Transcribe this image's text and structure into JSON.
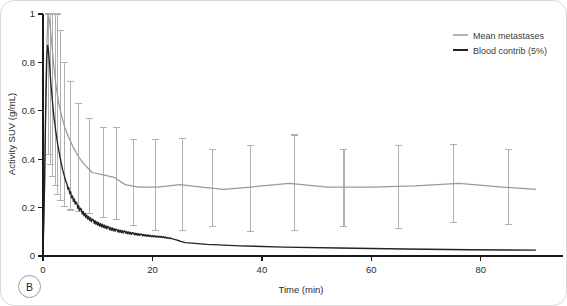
{
  "panel": {
    "letter": "B"
  },
  "legend": {
    "position": "top-right",
    "entries": [
      {
        "label": "Mean metastases",
        "color": "#9a9a9a",
        "style": "thin-line"
      },
      {
        "label": "Blood contrib (5%)",
        "color": "#242424",
        "style": "thick-line"
      }
    ]
  },
  "chart_data": {
    "type": "line",
    "title": "",
    "subtitle": "",
    "xlabel": "Time (min)",
    "ylabel": "Activity SUV (g/mL)",
    "xlim": [
      0,
      91
    ],
    "ylim": [
      0,
      1
    ],
    "xticks": [
      0,
      20,
      40,
      60,
      80
    ],
    "yticks": [
      0,
      0.2,
      0.4,
      0.6,
      0.8,
      1
    ],
    "xtick_labels": [
      "0",
      "20",
      "40",
      "60",
      "80"
    ],
    "ytick_labels": [
      "0",
      "0.2",
      "0.4",
      "0.6",
      "0.8",
      "1"
    ],
    "grid": false,
    "legend_position": "upper right",
    "annotations": [
      "B"
    ],
    "series": [
      {
        "name": "Mean metastases",
        "color": "#9a9a9a",
        "has_errorbars": true,
        "x": [
          0.0,
          0.3,
          0.6,
          0.9,
          1.2,
          1.6,
          2.0,
          2.4,
          2.9,
          3.4,
          4.0,
          4.7,
          5.5,
          6.5,
          7.5,
          9.0,
          11.0,
          13.0,
          15.0,
          17.5,
          21.0,
          25.0,
          29.0,
          33.0,
          38.0,
          45.0,
          52.0,
          60.0,
          68.0,
          76.0,
          84.0,
          90.0
        ],
        "values": [
          0.02,
          0.3,
          0.8,
          1.0,
          0.97,
          0.88,
          0.78,
          0.7,
          0.63,
          0.58,
          0.53,
          0.49,
          0.45,
          0.41,
          0.38,
          0.345,
          0.335,
          0.325,
          0.295,
          0.285,
          0.285,
          0.295,
          0.285,
          0.275,
          0.285,
          0.3,
          0.285,
          0.285,
          0.29,
          0.3,
          0.285,
          0.275
        ],
        "errorbars": {
          "x": [
            1.0,
            1.4,
            1.8,
            2.2,
            2.7,
            3.2,
            4.0,
            5.0,
            6.5,
            8.5,
            11.0,
            13.5,
            16.5,
            20.5,
            25.5,
            31.0,
            38.0,
            46.0,
            55.0,
            65.0,
            75.0,
            85.0
          ],
          "center": [
            1.0,
            0.93,
            0.82,
            0.74,
            0.66,
            0.6,
            0.53,
            0.46,
            0.405,
            0.355,
            0.335,
            0.325,
            0.295,
            0.285,
            0.295,
            0.285,
            0.275,
            0.3,
            0.285,
            0.285,
            0.3,
            0.285
          ],
          "upper": [
            1.0,
            1.0,
            1.0,
            1.0,
            1.0,
            0.93,
            0.8,
            0.72,
            0.63,
            0.57,
            0.53,
            0.53,
            0.48,
            0.48,
            0.485,
            0.44,
            0.455,
            0.5,
            0.44,
            0.455,
            0.46,
            0.44
          ],
          "lower": [
            0.42,
            0.38,
            0.33,
            0.29,
            0.255,
            0.23,
            0.205,
            0.19,
            0.185,
            0.175,
            0.16,
            0.15,
            0.125,
            0.105,
            0.105,
            0.12,
            0.1,
            0.105,
            0.12,
            0.115,
            0.14,
            0.13
          ]
        }
      },
      {
        "name": "Blood contrib (5%)",
        "color": "#242424",
        "has_errorbars": false,
        "x": [
          0.0,
          0.25,
          0.5,
          0.7,
          0.85,
          1.0,
          1.2,
          1.45,
          1.7,
          2.0,
          2.3,
          2.7,
          3.1,
          3.6,
          4.1,
          4.7,
          5.4,
          6.2,
          7.0,
          8.0,
          9.2,
          10.5,
          12.0,
          13.5,
          15.0,
          16.5,
          18.0,
          20.0,
          22.0,
          23.5,
          26.0,
          30.0,
          36.0,
          44.0,
          54.0,
          66.0,
          78.0,
          90.0
        ],
        "values": [
          0.005,
          0.25,
          0.62,
          0.82,
          0.87,
          0.85,
          0.79,
          0.71,
          0.645,
          0.575,
          0.52,
          0.46,
          0.41,
          0.355,
          0.315,
          0.275,
          0.24,
          0.21,
          0.185,
          0.162,
          0.143,
          0.128,
          0.115,
          0.105,
          0.098,
          0.092,
          0.087,
          0.082,
          0.078,
          0.072,
          0.055,
          0.048,
          0.042,
          0.037,
          0.033,
          0.029,
          0.026,
          0.024
        ]
      }
    ]
  }
}
